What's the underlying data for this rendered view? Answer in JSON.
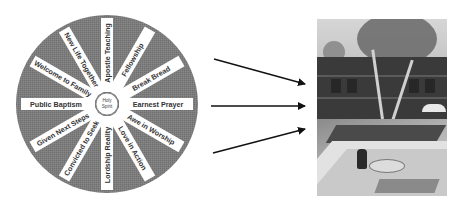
{
  "diagram": {
    "wheel": {
      "center_label_line1": "Holy",
      "center_label_line2": "Spirit",
      "fill_color": "#7b7b7b",
      "spoke_color": "#ffffff",
      "spokes": [
        {
          "label": "Earnest Prayer",
          "angle": 0
        },
        {
          "label": "Awe in Worship",
          "angle": 30
        },
        {
          "label": "Love in Action",
          "angle": 60
        },
        {
          "label": "Lordship Reality",
          "angle": 90
        },
        {
          "label": "Convicted to Seek",
          "angle": 120
        },
        {
          "label": "Given Next Steps",
          "angle": 150
        },
        {
          "label": "Public Baptism",
          "angle": 180
        },
        {
          "label": "Welcome to Family",
          "angle": 210
        },
        {
          "label": "New Life Together",
          "angle": 240
        },
        {
          "label": "Apostle Teaching",
          "angle": 270
        },
        {
          "label": "Fellowship",
          "angle": 300
        },
        {
          "label": "Break Bread",
          "angle": 330
        }
      ]
    },
    "arrows": [
      {
        "name": "arrow-top",
        "from": [
          214,
          59
        ],
        "to": [
          306,
          84
        ]
      },
      {
        "name": "arrow-middle",
        "from": [
          211,
          106
        ],
        "to": [
          306,
          106
        ]
      },
      {
        "name": "arrow-bottom",
        "from": [
          213,
          153
        ],
        "to": [
          306,
          129
        ]
      }
    ],
    "photo": {
      "description": "courtyard-with-trees-pool-and-patio-table"
    }
  }
}
